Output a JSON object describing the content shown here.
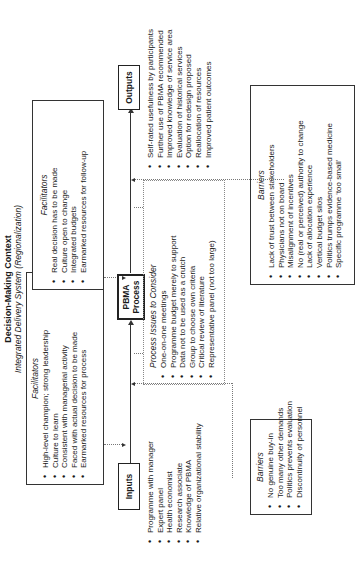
{
  "context": {
    "title": "Decision-Making Context",
    "subtitle": "Integrated Delivery System (Regionalization)"
  },
  "nodes": {
    "inputs": "Inputs",
    "process_line1": "PBMA",
    "process_line2": "Process",
    "outputs": "Outputs"
  },
  "facilitators_left": {
    "heading": "Facilitators",
    "items": [
      "High-level champion; strong leadership",
      "Culture to learn",
      "Consistent with managerial activity",
      "Faced with actual decision to be made",
      "Earmarked resources for process"
    ]
  },
  "facilitators_right": {
    "heading": "Facilitators",
    "items": [
      "Real decision has to be made",
      "Culture open to change",
      "Integrated budgets",
      "Earmarked resources for follow-up"
    ]
  },
  "process_issues": {
    "heading": "Process Issues to Consider",
    "items": [
      "One-on-one meetings",
      "Programme budget merely to support",
      "Data not to be used as a crutch",
      "Group to choose own criteria",
      "Critical review of literature",
      "Representative panel (not too large)"
    ]
  },
  "inputs_list": {
    "items": [
      "Programme with manager",
      "Expert panel",
      "Health economist",
      "Research associate",
      "Knowledge of PBMA",
      "Relative organizational stability"
    ]
  },
  "outputs_list": {
    "items": [
      "Self-rated usefulness by participants",
      "Further use of PBMA recommended",
      "Improved knowledge of service area",
      "Evaluation of historical services",
      "Option for redesign proposed",
      "Reallocation of resources",
      "Improved patient outcomes"
    ]
  },
  "barriers_left": {
    "heading": "Barriers",
    "items": [
      "No genuine buy-in",
      "Too many other demands",
      "Politics prevents evaluation",
      "Discontinuity of personnel"
    ]
  },
  "barriers_right": {
    "heading": "Barriers",
    "items": [
      "Lack of trust between stakeholders",
      "Physicians not on board",
      "Misalignment of incentives",
      "No (real or perceived) authority to change",
      "Lack of allocation experience",
      "Vertical budget silos",
      "Politics trumps evidence-based medicine",
      "Specific programme 'too small'"
    ]
  }
}
